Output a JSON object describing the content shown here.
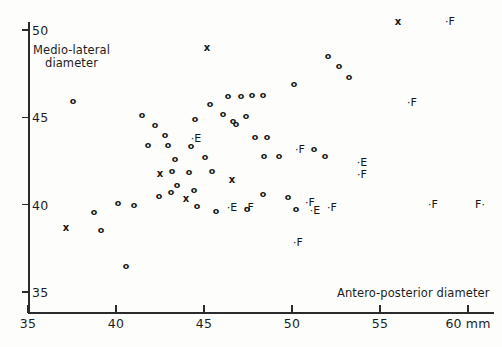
{
  "chart_data": {
    "type": "scatter",
    "title": "",
    "xlabel": "Antero-posterior diameter",
    "ylabel": "Medio-lateral\ndiameter",
    "x_unit": "mm",
    "xlim": [
      35,
      61.5
    ],
    "ylim": [
      34.4,
      50.6
    ],
    "xticks": [
      35,
      40,
      45,
      50,
      55,
      60
    ],
    "xtick_labels": [
      "35",
      "40",
      "45",
      "50",
      "55",
      "60 mm"
    ],
    "yticks": [
      35,
      40,
      45,
      50
    ],
    "ytick_labels": [
      "35",
      "40",
      "45",
      "50"
    ],
    "grid": false,
    "legend": "none",
    "marker_kinds": [
      "o",
      "X",
      "·E",
      "·F",
      "E·",
      "F·"
    ],
    "series": [
      {
        "name": "o",
        "marker": "o",
        "points": [
          [
            38.8,
            45.9
          ],
          [
            42.6,
            45.1
          ],
          [
            43.3,
            44.5
          ],
          [
            42.9,
            43.7
          ],
          [
            43.9,
            43.7
          ],
          [
            45.1,
            43.6
          ],
          [
            43.6,
            42.8
          ],
          [
            43.3,
            42.1
          ],
          [
            44.2,
            42.0
          ],
          [
            45.0,
            42.9
          ],
          [
            45.9,
            42.1
          ],
          [
            45.0,
            44.1
          ],
          [
            46.2,
            45.0
          ],
          [
            46.9,
            44.4
          ],
          [
            47.4,
            44.0
          ],
          [
            47.1,
            45.4
          ],
          [
            47.9,
            45.4
          ],
          [
            48.4,
            45.5
          ],
          [
            49.0,
            45.5
          ],
          [
            48.1,
            44.3
          ],
          [
            47.6,
            43.9
          ],
          [
            48.6,
            43.1
          ],
          [
            49.2,
            43.1
          ],
          [
            49.1,
            42.1
          ],
          [
            49.9,
            42.1
          ],
          [
            50.7,
            46.0
          ],
          [
            51.6,
            46.7
          ],
          [
            52.2,
            46.4
          ],
          [
            52.8,
            45.8
          ],
          [
            51.6,
            43.2
          ],
          [
            52.3,
            42.8
          ],
          [
            50.1,
            41.0
          ],
          [
            48.4,
            41.2
          ],
          [
            47.9,
            40.3
          ],
          [
            42.2,
            41.4
          ],
          [
            41.3,
            41.5
          ],
          [
            39.6,
            40.4
          ],
          [
            40.2,
            39.2
          ],
          [
            41.5,
            38.1
          ],
          [
            46.3,
            40.0
          ],
          [
            46.1,
            41.0
          ],
          [
            44.9,
            41.4
          ],
          [
            50.6,
            40.4
          ],
          [
            44.6,
            41.2
          ],
          [
            43.8,
            41.0
          ],
          [
            47.2,
            40.1
          ]
        ]
      },
      {
        "name": "X",
        "marker": "X",
        "points": [
          [
            45.8,
            48.7
          ],
          [
            43.5,
            42.5
          ],
          [
            45.2,
            41.0
          ],
          [
            44.8,
            40.6
          ],
          [
            48.1,
            42.6
          ],
          [
            38.0,
            39.6
          ],
          [
            56.8,
            50.2
          ]
        ]
      },
      {
        "name": "E",
        "marker": "·E",
        "points": [
          [
            45.5,
            43.9
          ],
          [
            52.5,
            41.5
          ],
          [
            46.8,
            40.2
          ],
          [
            50.2,
            39.8
          ]
        ]
      },
      {
        "name": "F",
        "marker": "·F",
        "points": [
          [
            59.0,
            50.2
          ],
          [
            55.4,
            45.7
          ],
          [
            50.3,
            42.5
          ],
          [
            52.5,
            40.8
          ],
          [
            52.0,
            39.8
          ],
          [
            56.5,
            39.9
          ],
          [
            60.3,
            39.9
          ],
          [
            47.8,
            39.9
          ],
          [
            51.4,
            38.6
          ],
          [
            50.9,
            40.1
          ]
        ]
      }
    ]
  },
  "axis": {
    "x_title": "Antero-posterior diameter",
    "y_title_line1": "Medio-lateral",
    "y_title_line2": "diameter",
    "x_labels": [
      "35",
      "40",
      "45",
      "50",
      "55",
      "60 mm"
    ],
    "y_labels": [
      "50",
      "45",
      "40",
      "35"
    ]
  },
  "markers": [
    {
      "g": "o",
      "x": 73,
      "y": 101
    },
    {
      "g": "o",
      "x": 142,
      "y": 115
    },
    {
      "g": "o",
      "x": 155,
      "y": 125
    },
    {
      "g": "o",
      "x": 165,
      "y": 135
    },
    {
      "g": "o",
      "x": 148,
      "y": 145
    },
    {
      "g": "o",
      "x": 168,
      "y": 145
    },
    {
      "g": "o",
      "x": 191,
      "y": 146
    },
    {
      "g": "o",
      "x": 175,
      "y": 159
    },
    {
      "g": "o",
      "x": 172,
      "y": 171
    },
    {
      "g": "o",
      "x": 189,
      "y": 172
    },
    {
      "g": "o",
      "x": 205,
      "y": 157
    },
    {
      "g": "o",
      "x": 212,
      "y": 171
    },
    {
      "g": "o",
      "x": 195,
      "y": 119
    },
    {
      "g": "o",
      "x": 210,
      "y": 104
    },
    {
      "g": "o",
      "x": 223,
      "y": 114
    },
    {
      "g": "o",
      "x": 233,
      "y": 121
    },
    {
      "g": "o",
      "x": 228,
      "y": 96
    },
    {
      "g": "o",
      "x": 241,
      "y": 96
    },
    {
      "g": "o",
      "x": 252,
      "y": 95
    },
    {
      "g": "o",
      "x": 263,
      "y": 95
    },
    {
      "g": "o",
      "x": 246,
      "y": 116
    },
    {
      "g": "o",
      "x": 236,
      "y": 124
    },
    {
      "g": "o",
      "x": 255,
      "y": 137
    },
    {
      "g": "o",
      "x": 267,
      "y": 137
    },
    {
      "g": "o",
      "x": 264,
      "y": 156
    },
    {
      "g": "o",
      "x": 279,
      "y": 156
    },
    {
      "g": "o",
      "x": 294,
      "y": 84
    },
    {
      "g": "o",
      "x": 328,
      "y": 56
    },
    {
      "g": "o",
      "x": 339,
      "y": 66
    },
    {
      "g": "o",
      "x": 349,
      "y": 77
    },
    {
      "g": "o",
      "x": 314,
      "y": 149
    },
    {
      "g": "o",
      "x": 325,
      "y": 156
    },
    {
      "g": "o",
      "x": 288,
      "y": 197
    },
    {
      "g": "o",
      "x": 263,
      "y": 194
    },
    {
      "g": "o",
      "x": 247,
      "y": 209
    },
    {
      "g": "o",
      "x": 134,
      "y": 205
    },
    {
      "g": "o",
      "x": 118,
      "y": 203
    },
    {
      "g": "o",
      "x": 94,
      "y": 212
    },
    {
      "g": "o",
      "x": 101,
      "y": 230
    },
    {
      "g": "o",
      "x": 126,
      "y": 266
    },
    {
      "g": "o",
      "x": 197,
      "y": 206
    },
    {
      "g": "o",
      "x": 194,
      "y": 190
    },
    {
      "g": "o",
      "x": 177,
      "y": 185
    },
    {
      "g": "o",
      "x": 296,
      "y": 209
    },
    {
      "g": "o",
      "x": 171,
      "y": 192
    },
    {
      "g": "o",
      "x": 159,
      "y": 196
    },
    {
      "g": "o",
      "x": 216,
      "y": 211
    },
    {
      "g": "X",
      "x": 207,
      "y": 48
    },
    {
      "g": "X",
      "x": 160,
      "y": 174
    },
    {
      "g": "X",
      "x": 186,
      "y": 199
    },
    {
      "g": "X",
      "x": 232,
      "y": 180
    },
    {
      "g": "X",
      "x": 66,
      "y": 228
    },
    {
      "g": "X",
      "x": 398,
      "y": 22
    },
    {
      "g": "E",
      "x": 196,
      "y": 139
    },
    {
      "g": "E",
      "x": 362,
      "y": 163
    },
    {
      "g": "E",
      "x": 232,
      "y": 208
    },
    {
      "g": "E",
      "x": 315,
      "y": 211
    },
    {
      "g": "F",
      "x": 450,
      "y": 22
    },
    {
      "g": "F",
      "x": 412,
      "y": 103
    },
    {
      "g": "F",
      "x": 300,
      "y": 150
    },
    {
      "g": "F",
      "x": 362,
      "y": 175
    },
    {
      "g": "F",
      "x": 332,
      "y": 208
    },
    {
      "g": "F",
      "x": 433,
      "y": 205
    },
    {
      "g": "F",
      "x": 249,
      "y": 208
    },
    {
      "g": "F",
      "x": 298,
      "y": 243
    },
    {
      "g": "F",
      "x": 310,
      "y": 203
    },
    {
      "g": "Fr",
      "x": 480,
      "y": 205
    }
  ]
}
